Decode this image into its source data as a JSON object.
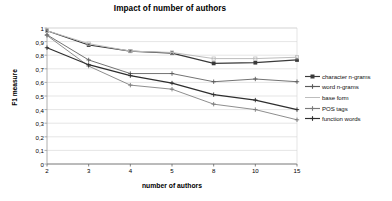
{
  "chart_data": {
    "type": "line",
    "title": "Impact of number of authors",
    "xlabel": "number of authors",
    "ylabel": "F1 measure",
    "categories": [
      "2",
      "3",
      "4",
      "5",
      "8",
      "10",
      "15"
    ],
    "ylim": [
      0,
      1
    ],
    "yticks": [
      "0",
      "0,1",
      "0,2",
      "0,3",
      "0,4",
      "0,5",
      "0,6",
      "0,7",
      "0,8",
      "0,9",
      "1"
    ],
    "ytick_values": [
      0,
      0.1,
      0.2,
      0.3,
      0.4,
      0.5,
      0.6,
      0.7,
      0.8,
      0.9,
      1
    ],
    "grid": "horizontal",
    "legend_position": "right",
    "series": [
      {
        "name": "character n-grams",
        "marker": "square",
        "color": "#3a3a3a",
        "values": [
          0.98,
          0.875,
          0.83,
          0.815,
          0.74,
          0.745,
          0.765
        ]
      },
      {
        "name": "word n-grams",
        "marker": "plus",
        "color": "#5a5a5a",
        "values": [
          0.95,
          0.765,
          0.665,
          0.665,
          0.605,
          0.625,
          0.605
        ]
      },
      {
        "name": "base form",
        "marker": "none",
        "color": "#bdbdbd",
        "values": [
          0.98,
          0.885,
          0.83,
          0.82,
          0.775,
          0.775,
          0.785
        ]
      },
      {
        "name": "POS tags",
        "marker": "plus",
        "color": "#7a7a7a",
        "values": [
          0.945,
          0.72,
          0.58,
          0.55,
          0.44,
          0.4,
          0.325
        ]
      },
      {
        "name": "function words",
        "marker": "plus",
        "color": "#2e2e2e",
        "values": [
          0.855,
          0.73,
          0.65,
          0.595,
          0.51,
          0.47,
          0.4
        ]
      }
    ]
  }
}
